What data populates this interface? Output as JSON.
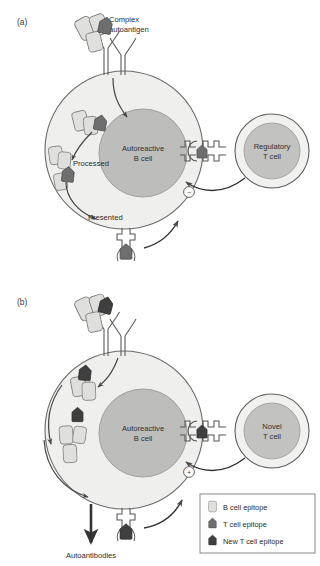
{
  "figure": {
    "width": 320,
    "height": 566,
    "background": "#ffffff"
  },
  "colors": {
    "b_cell_epitope": "#dfdfdc",
    "t_cell_epitope": "#6e6e6e",
    "new_t_cell_epitope": "#3f3f3f",
    "cytoplasm": "#efefed",
    "nucleus": "#bdbdbb",
    "tcell_cytoplasm": "#f1f1ef",
    "tcell_nucleus": "#c2c2c0",
    "outline": "#5a5a5a",
    "arrow": "#4a4a4a",
    "text": "#2b2b2b",
    "legend_border": "#8a8a8a"
  },
  "panels": [
    {
      "id": "a",
      "label": "(a)",
      "antigen_label_line1": "Complex",
      "antigen_label_line2": "autoantigen",
      "b_cell_label_line1": "Autoreactive",
      "b_cell_label_line2": "B cell",
      "t_cell_label_line1": "Regulatory",
      "t_cell_label_line2": "T cell",
      "processed_label": "Processed",
      "presented_label": "Presented",
      "sign": "−",
      "sign_meaning": "inhibition",
      "surface_epitope": "t_cell_epitope",
      "presented_epitope": "t_cell_epitope"
    },
    {
      "id": "b",
      "label": "(b)",
      "antigen_label_line1": "",
      "antigen_label_line2": "",
      "b_cell_label_line1": "Autoreactive",
      "b_cell_label_line2": "B cell",
      "t_cell_label_line1": "Novel",
      "t_cell_label_line2": "T cell",
      "output_label": "Autoantibodies",
      "sign": "+",
      "sign_meaning": "activation",
      "surface_epitope": "new_t_cell_epitope",
      "presented_epitope": "new_t_cell_epitope"
    }
  ],
  "legend": {
    "items": [
      {
        "label": "B cell epitope",
        "swatch": "b_cell_epitope"
      },
      {
        "label": "T cell epitope",
        "swatch": "t_cell_epitope"
      },
      {
        "label": "New T cell epitope",
        "swatch": "new_t_cell_epitope"
      }
    ]
  }
}
